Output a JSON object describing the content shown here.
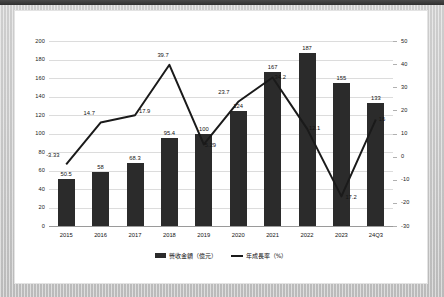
{
  "chart_data": {
    "type": "bar",
    "title": "",
    "subtitle": "",
    "xlabel": "",
    "ylabel": "",
    "categories": [
      "2015",
      "2016",
      "2017",
      "2018",
      "2019",
      "2020",
      "2021",
      "2022",
      "2023",
      "24Q3"
    ],
    "series": [
      {
        "name": "營收金額（億元）",
        "type": "bar",
        "axis": "left",
        "color": "#2b2b2b",
        "values": [
          50.5,
          58,
          68.3,
          95.4,
          100,
          124,
          167,
          187,
          155,
          133
        ],
        "labels": [
          "50.5",
          "58",
          "68.3",
          "95.4",
          "100",
          "124",
          "167",
          "187",
          "155",
          "133"
        ]
      },
      {
        "name": "年成長率（%）",
        "type": "line",
        "axis": "right",
        "color": "#1a1a1a",
        "values": [
          -3.33,
          14.7,
          17.9,
          39.7,
          5.29,
          23.7,
          34.2,
          12.1,
          -17.2,
          16
        ],
        "labels": [
          "-3.33",
          "14.7",
          "17.9",
          "39.7",
          "5.29",
          "23.7",
          "34.2",
          "12.1",
          "17.2",
          "16"
        ]
      }
    ],
    "left_axis": {
      "ticks": [
        "0",
        "20",
        "40",
        "60",
        "80",
        "100",
        "120",
        "140",
        "160",
        "180",
        "200"
      ],
      "ylim": [
        0,
        200
      ],
      "step": 20
    },
    "right_axis": {
      "ticks": [
        "-30",
        "-20",
        "-10",
        "0",
        "10",
        "20",
        "30",
        "40",
        "50"
      ],
      "ylim": [
        -30,
        50
      ],
      "step": 10
    },
    "grid": true,
    "legend_position": "bottom",
    "legend": [
      "營收金額（億元）",
      "年成長率（%）"
    ]
  }
}
